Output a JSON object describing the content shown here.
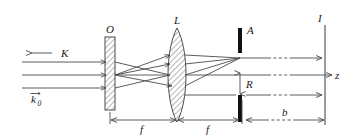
{
  "figure": {
    "type": "ray-diagram",
    "width": 350,
    "height": 140,
    "background": "#ffffff",
    "ink": "#4a4a4a"
  },
  "labels": {
    "incident_wave": "K",
    "wavevector": "k",
    "wavevector_sub": "0",
    "object": "O",
    "lens": "L",
    "aperture": "A",
    "image_plane": "I",
    "radius": "R",
    "focal_1": "f",
    "focal_2": "f",
    "distance_b": "b",
    "axis": "z"
  },
  "components": [
    {
      "id": "object",
      "label": "O",
      "kind": "hatched-plate",
      "x": 105,
      "y": 37,
      "width": 10,
      "height": 73
    },
    {
      "id": "lens",
      "label": "L",
      "kind": "biconvex-lens",
      "cx": 177,
      "cy": 75,
      "half_width": 12,
      "half_height": 47
    },
    {
      "id": "aperture-stop-upper",
      "label": "A",
      "kind": "opaque-bar",
      "x": 238,
      "y": 28,
      "width": 4,
      "height": 25
    },
    {
      "id": "aperture-stop-lower",
      "label": "",
      "kind": "opaque-bar",
      "x": 238,
      "y": 95,
      "width": 4,
      "height": 27
    },
    {
      "id": "image-plane",
      "label": "I",
      "kind": "vertical-line",
      "x": 325,
      "y_top": 25,
      "y_bottom": 125
    }
  ],
  "rays": {
    "incident_y": [
      62,
      75,
      88
    ],
    "incident_x_start": 22,
    "incident_x_end": 105,
    "focus_point": {
      "x": 240,
      "y": 58
    },
    "output_y": [
      58,
      75,
      95
    ]
  },
  "dimensions": [
    {
      "name": "focal-length-1",
      "label": "f",
      "from_x": 110,
      "to_x": 177,
      "y": 120
    },
    {
      "name": "focal-length-2",
      "label": "f",
      "from_x": 177,
      "to_x": 240,
      "y": 120
    },
    {
      "name": "aperture-radius",
      "label": "R",
      "x": 240,
      "from_y": 72,
      "to_y": 95
    },
    {
      "name": "propagation-distance",
      "label": "b",
      "from_x": 246,
      "to_x": 325,
      "y": 120
    }
  ],
  "colors": {
    "ink": "#4a4a4a",
    "barrier": "#111111",
    "text": "#1a1a1a",
    "hatch": "#6e6e6e"
  }
}
